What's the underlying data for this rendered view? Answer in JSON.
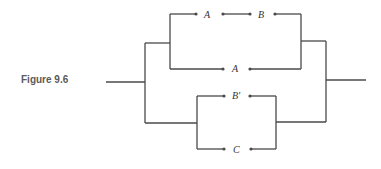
{
  "figure": {
    "caption": "Figure 9.6",
    "type": "switching circuit",
    "switches": {
      "top_1": "A",
      "top_2": "B",
      "middle": "A",
      "lower_1": "B'",
      "lower_2": "C"
    }
  }
}
